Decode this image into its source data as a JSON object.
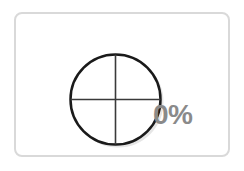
{
  "widget": {
    "icon": "crosshair-circle-icon",
    "progress_label": "0%",
    "progress_value": 0
  },
  "colors": {
    "card_border": "#d9d9d9",
    "circle_stroke": "#1a1a1a",
    "crosshair_stroke": "#3a3a3a",
    "label": "#8a8a8a"
  }
}
